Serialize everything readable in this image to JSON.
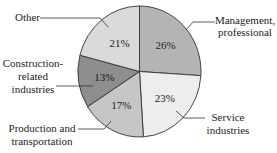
{
  "chart_data": {
    "type": "pie",
    "title": "",
    "start_angle_deg": -90,
    "direction": "clockwise",
    "slices": [
      {
        "label": "Management, professional",
        "value": 26,
        "display": "26%",
        "color": "#b4b4b4"
      },
      {
        "label": "Service industries",
        "value": 23,
        "display": "23%",
        "color": "#ededed"
      },
      {
        "label": "Production and transportation",
        "value": 17,
        "display": "17%",
        "color": "#c6c6c6"
      },
      {
        "label": "Construction-related industries",
        "value": 13,
        "display": "13%",
        "color": "#8e8e8e"
      },
      {
        "label": "Other",
        "value": 21,
        "display": "21%",
        "color": "#dadada"
      }
    ]
  },
  "labels": {
    "other": "Other",
    "management_line1": "Management,",
    "management_line2": "professional",
    "construction_line1": "Construction-",
    "construction_line2": "related",
    "construction_line3": "industries",
    "service_line1": "Service",
    "service_line2": "industries",
    "production_line1": "Production and",
    "production_line2": "transportation"
  }
}
